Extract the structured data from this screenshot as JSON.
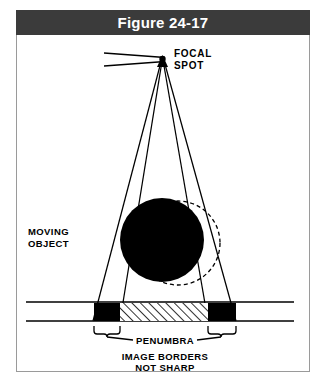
{
  "figure": {
    "title": "Figure 24-17",
    "title_bar_color": "#3b3b3b",
    "title_text_color": "#ffffff",
    "panel_border_color": "#9a9a9a",
    "ink_color": "#000000",
    "background_color": "#ffffff"
  },
  "labels": {
    "focal_line1": "FOCAL",
    "focal_line2": "SPOT",
    "object_line1": "MOVING",
    "object_line2": "OBJECT",
    "penumbra": "PENUMBRA",
    "caption_line1": "IMAGE BORDERS",
    "caption_line2": "NOT SHARP"
  },
  "diagram": {
    "focal_spot": {
      "x": 146,
      "y": 23,
      "marker": "filled-triangle"
    },
    "anode_lines": [
      {
        "x1": 88,
        "y1": 18,
        "x2": 149,
        "y2": 22
      },
      {
        "x1": 88,
        "y1": 30,
        "x2": 149,
        "y2": 26
      }
    ],
    "beams": [
      {
        "x1": 145,
        "y1": 24,
        "x2": 77,
        "y2": 280,
        "name": "outer-left-ray"
      },
      {
        "x1": 146,
        "y1": 24,
        "x2": 104,
        "y2": 280,
        "name": "inner-left-ray"
      },
      {
        "x1": 147,
        "y1": 24,
        "x2": 192,
        "y2": 280,
        "name": "inner-right-ray"
      },
      {
        "x1": 148,
        "y1": 24,
        "x2": 220,
        "y2": 280,
        "name": "outer-right-ray"
      }
    ],
    "solid_object": {
      "cx": 146,
      "cy": 205,
      "r": 42,
      "fill": "#000000"
    },
    "dashed_object": {
      "cx": 162,
      "cy": 208,
      "r": 42,
      "stroke_dash": "4 3"
    },
    "detector": {
      "line_top_y": 266,
      "line_bottom_y": 285,
      "line_x_start": 10,
      "line_x_end": 278
    },
    "umbra_blocks": [
      {
        "x": 78,
        "y": 267,
        "w": 26,
        "h": 18,
        "name": "left-umbra-block"
      },
      {
        "x": 192,
        "y": 267,
        "w": 28,
        "h": 18,
        "name": "right-umbra-block"
      }
    ],
    "penumbra_band": {
      "x": 104,
      "y": 267,
      "w": 88,
      "h": 18,
      "pattern": "diagonal-hatch"
    },
    "braces": [
      {
        "x1": 78,
        "x2": 104,
        "y": 292,
        "name": "left-penumbra-brace"
      },
      {
        "x1": 192,
        "x2": 220,
        "y": 292,
        "name": "right-penumbra-brace"
      }
    ],
    "leader_lines": [
      {
        "x1": 90,
        "y1": 300,
        "x2": 120,
        "y2": 300
      },
      {
        "x1": 176,
        "y1": 300,
        "x2": 206,
        "y2": 300
      }
    ]
  }
}
